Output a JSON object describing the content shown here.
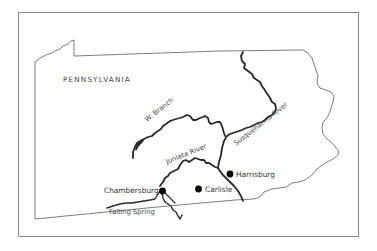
{
  "map": {
    "title": "PENNSYLVANIA",
    "colors": {
      "background": "#ffffff",
      "frame": "#8a8a8a",
      "state_border": "#6e6e6e",
      "river": "#2a2a2a",
      "city_dot": "#000000",
      "text": "#333333"
    },
    "rivers": [
      {
        "id": "w-branch",
        "label": "W. Branch"
      },
      {
        "id": "susquehanna",
        "label": "Susquehanna River"
      },
      {
        "id": "juniata",
        "label": "Juniata River"
      },
      {
        "id": "falling-spring",
        "label": "Falling Spring"
      }
    ],
    "cities": [
      {
        "id": "harrisburg",
        "label": "Harrisburg"
      },
      {
        "id": "carlisle",
        "label": "Carlisle"
      },
      {
        "id": "chambersburg",
        "label": "Chambersburg"
      }
    ]
  }
}
